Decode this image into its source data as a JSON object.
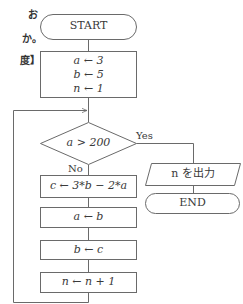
{
  "side_text": [
    "お",
    "か。",
    "度】"
  ],
  "flowchart": {
    "start": "START",
    "init": [
      "a ← 3",
      "b ← 5",
      "n ← 1"
    ],
    "decision": "a > 200",
    "yes_label": "Yes",
    "no_label": "No",
    "steps": [
      "c ← 3*b − 2*a",
      "a ← b",
      "b ← c",
      "n ← n + 1"
    ],
    "output": "n を出力",
    "end": "END"
  },
  "colors": {
    "line": "#6a6a6a",
    "text": "#3a3a3a",
    "background": "#ffffff"
  }
}
